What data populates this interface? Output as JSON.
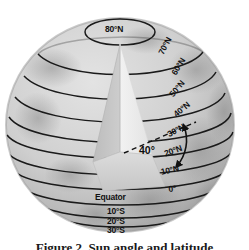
{
  "figure": {
    "title_caption": "Figure 2. Sun angle and latitude",
    "angle_label": "40°",
    "latitude_labels": [
      {
        "id": "lat-80n",
        "text": "80°N",
        "x": 105,
        "y": 25,
        "rotation": 0
      },
      {
        "id": "lat-70n",
        "text": "70°N",
        "x": 157,
        "y": 52,
        "rotation": -62
      },
      {
        "id": "lat-60n",
        "text": "60°N",
        "x": 170,
        "y": 72,
        "rotation": -58
      },
      {
        "id": "lat-50n",
        "text": "50°N",
        "x": 168,
        "y": 93,
        "rotation": -50
      },
      {
        "id": "lat-40n",
        "text": "40°N",
        "x": 172,
        "y": 112,
        "rotation": -40
      },
      {
        "id": "lat-30n",
        "text": "30°N",
        "x": 166,
        "y": 131,
        "rotation": -28
      },
      {
        "id": "lat-20n",
        "text": "20°N",
        "x": 163,
        "y": 150,
        "rotation": -20
      },
      {
        "id": "lat-10n",
        "text": "10°N",
        "x": 160,
        "y": 168,
        "rotation": -12
      },
      {
        "id": "lat-0",
        "text": "0°",
        "x": 168,
        "y": 185,
        "rotation": -6
      },
      {
        "id": "lat-equator",
        "text": "Equator",
        "x": 95,
        "y": 193,
        "rotation": 0
      },
      {
        "id": "lat-10s",
        "text": "10°S",
        "x": 107,
        "y": 207,
        "rotation": 0
      },
      {
        "id": "lat-20s",
        "text": "20°S",
        "x": 107,
        "y": 217,
        "rotation": 0
      },
      {
        "id": "lat-30s",
        "text": "30°S",
        "x": 107,
        "y": 226,
        "rotation": 0
      }
    ],
    "colors": {
      "globe_light": "#d9d9d9",
      "globe_mid": "#c4c4c4",
      "globe_dark": "#a8a8a8",
      "wedge_light": "#ececec",
      "wedge_dark": "#c0c0c0",
      "wedge_base": "#d2d2d2",
      "line": "#1a1a1a",
      "background": "#ffffff"
    }
  }
}
